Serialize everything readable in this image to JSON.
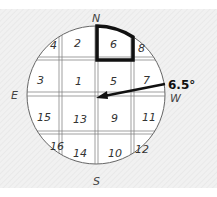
{
  "diagram": {
    "type": "grid-on-circle-compass",
    "directions": {
      "north": "N",
      "south": "S",
      "east": "E",
      "west": "W"
    },
    "angle_label": "6.5°",
    "highlighted_cell": "6",
    "cells": {
      "r0c0": "4",
      "r0c1": "2",
      "r0c2": "6",
      "r0c3": "8",
      "r1c0": "3",
      "r1c1": "1",
      "r1c2": "5",
      "r1c3": "7",
      "r2c0": "15",
      "r2c1": "13",
      "r2c2": "9",
      "r2c3": "11",
      "r3c0": "16",
      "r3c1": "14",
      "r3c2": "10",
      "r3c3": "12"
    },
    "colors": {
      "line": "#555555",
      "highlight": "#111111",
      "arrow": "#111111"
    }
  }
}
